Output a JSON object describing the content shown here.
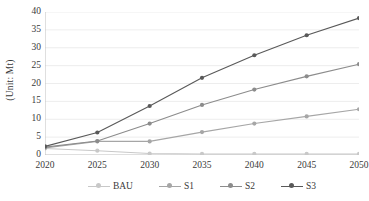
{
  "chart_data": {
    "type": "line",
    "title": "",
    "xlabel": "",
    "ylabel": "(Unit: Mt)",
    "categories": [
      "2020",
      "2025",
      "2030",
      "2035",
      "2040",
      "2045",
      "2050"
    ],
    "x": [
      2020,
      2025,
      2030,
      2035,
      2040,
      2045,
      2050
    ],
    "xlim": [
      2020,
      2050
    ],
    "ylim": [
      0,
      40
    ],
    "yticks": [
      0,
      5,
      10,
      15,
      20,
      25,
      30,
      35,
      40
    ],
    "ytick_labels": [
      "0",
      "5",
      "10",
      "15",
      "20",
      "25",
      "30",
      "35",
      "40"
    ],
    "grid": "horizontal",
    "legend_position": "bottom",
    "series": [
      {
        "name": "BAU",
        "color": "#c8c8c8",
        "marker": "circle",
        "values": [
          1.8,
          1.2,
          0.4,
          0.3,
          0.3,
          0.3,
          0.3
        ]
      },
      {
        "name": "S1",
        "color": "#a6a6a6",
        "marker": "circle",
        "values": [
          2.0,
          3.8,
          3.8,
          6.4,
          8.8,
          10.8,
          12.8
        ]
      },
      {
        "name": "S2",
        "color": "#8c8c8c",
        "marker": "circle",
        "values": [
          2.2,
          3.9,
          8.8,
          14.0,
          18.3,
          22.0,
          25.4
        ]
      },
      {
        "name": "S3",
        "color": "#595959",
        "marker": "circle",
        "values": [
          2.4,
          6.3,
          13.7,
          21.6,
          27.9,
          33.5,
          38.3
        ]
      }
    ]
  },
  "legend": {
    "items": [
      {
        "label": "BAU"
      },
      {
        "label": "S1"
      },
      {
        "label": "S2"
      },
      {
        "label": "S3"
      }
    ]
  },
  "axes": {
    "y_title": "(Unit: Mt)"
  },
  "colors": {
    "grid": "#e8e8e8",
    "axis": "#bfbfbf",
    "text": "#3a3a3a",
    "background": "#ffffff"
  }
}
